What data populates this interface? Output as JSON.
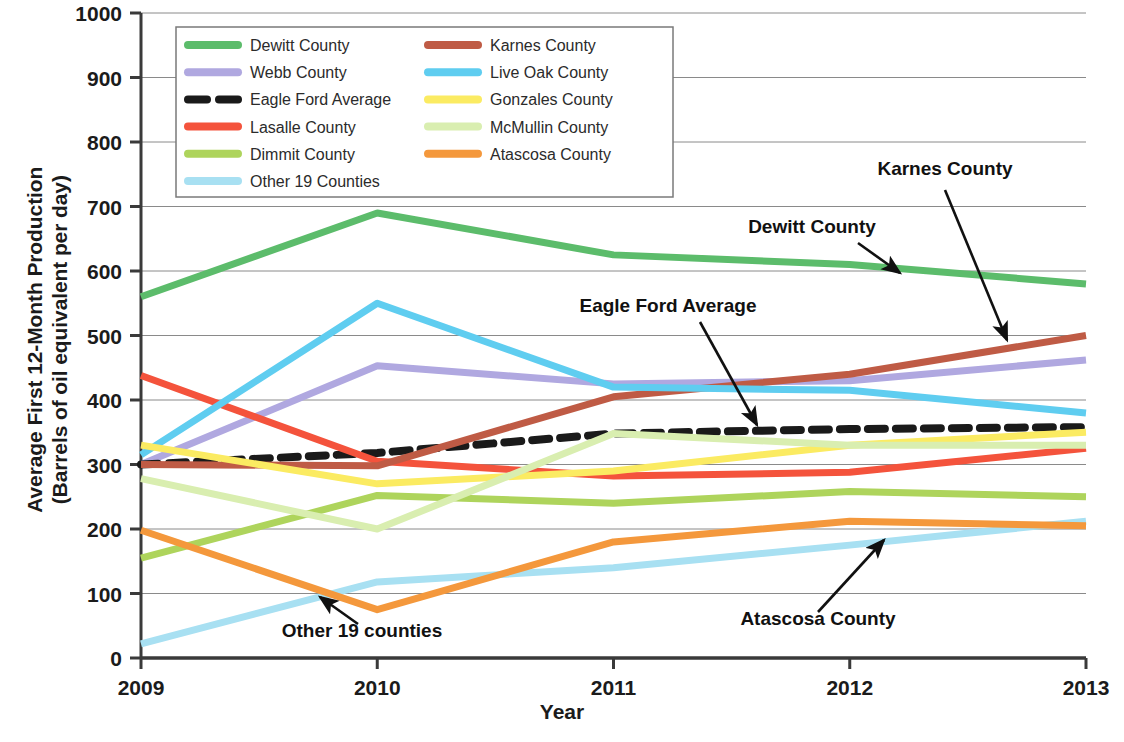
{
  "chart_data": {
    "type": "line",
    "title": "",
    "xlabel": "Year",
    "ylabel": "Average First 12-Month Production (Barrels of oil equivalent per day)",
    "ylabel_line1": "Average First 12-Month Production",
    "ylabel_line2": "(Barrels of oil equivalent per day)",
    "x": [
      2009,
      2010,
      2011,
      2012,
      2013
    ],
    "categories": [
      "2009",
      "2010",
      "2011",
      "2012",
      "2013"
    ],
    "xtick_labels": [
      "2009",
      "2010",
      "2011",
      "2012",
      "2013"
    ],
    "ytick_labels": [
      "0",
      "100",
      "200",
      "300",
      "400",
      "500",
      "600",
      "700",
      "800",
      "900",
      "1000"
    ],
    "ytick_values": [
      0,
      100,
      200,
      300,
      400,
      500,
      600,
      700,
      800,
      900,
      1000
    ],
    "ylim": [
      0,
      1000
    ],
    "xlim": [
      2009,
      2013
    ],
    "grid": "horizontal",
    "legend_position": "top-left-inside",
    "series": [
      {
        "name": "Dewitt County",
        "color": "#5cbc6b",
        "dash": false,
        "values": [
          560,
          690,
          625,
          610,
          580
        ]
      },
      {
        "name": "Webb County",
        "color": "#b0a8e0",
        "dash": false,
        "values": [
          300,
          453,
          425,
          430,
          462
        ]
      },
      {
        "name": "Eagle Ford Average",
        "color": "#1a1a1a",
        "dash": true,
        "values": [
          300,
          318,
          348,
          355,
          358
        ]
      },
      {
        "name": "Lasalle County",
        "color": "#f4533c",
        "dash": false,
        "values": [
          438,
          305,
          282,
          288,
          325
        ]
      },
      {
        "name": "Dimmit County",
        "color": "#aed45c",
        "dash": false,
        "values": [
          155,
          252,
          240,
          258,
          250
        ]
      },
      {
        "name": "Other 19 Counties",
        "color": "#a8e0f2",
        "dash": false,
        "values": [
          22,
          118,
          140,
          175,
          212
        ]
      },
      {
        "name": "Karnes County",
        "color": "#bf5b45",
        "dash": false,
        "values": [
          300,
          298,
          405,
          440,
          500
        ]
      },
      {
        "name": "Live Oak County",
        "color": "#5fcdf0",
        "dash": false,
        "values": [
          315,
          550,
          420,
          415,
          380
        ]
      },
      {
        "name": "Gonzales County",
        "color": "#fbeb62",
        "dash": false,
        "values": [
          330,
          270,
          290,
          330,
          350
        ]
      },
      {
        "name": "McMullin County",
        "color": "#d9eeb0",
        "dash": false,
        "values": [
          278,
          200,
          348,
          330,
          330
        ]
      },
      {
        "name": "Atascosa County",
        "color": "#f4983c",
        "dash": false,
        "values": [
          198,
          75,
          180,
          212,
          205
        ]
      }
    ],
    "annotations": [
      {
        "label": "Karnes County",
        "text_x": 945,
        "text_y": 175,
        "arrow_from_x": 945,
        "arrow_from_y": 190,
        "arrow_to_x": 1007,
        "arrow_to_y": 340
      },
      {
        "label": "Dewitt County",
        "text_x": 812,
        "text_y": 233,
        "arrow_from_x": 858,
        "arrow_from_y": 243,
        "arrow_to_x": 900,
        "arrow_to_y": 273
      },
      {
        "label": "Eagle Ford Average",
        "text_x": 668,
        "text_y": 312,
        "arrow_from_x": 700,
        "arrow_from_y": 322,
        "arrow_to_x": 757,
        "arrow_to_y": 425
      },
      {
        "label": "Atascosa County",
        "text_x": 818,
        "text_y": 625,
        "arrow_from_x": 818,
        "arrow_from_y": 612,
        "arrow_to_x": 884,
        "arrow_to_y": 540
      },
      {
        "label": "Other 19 counties",
        "text_x": 362,
        "text_y": 637,
        "arrow_from_x": 358,
        "arrow_from_y": 624,
        "arrow_to_x": 320,
        "arrow_to_y": 597
      }
    ]
  },
  "legend": {
    "entries": [
      {
        "label": "Dewitt County"
      },
      {
        "label": "Webb County"
      },
      {
        "label": "Eagle Ford Average"
      },
      {
        "label": "Lasalle County"
      },
      {
        "label": "Dimmit County"
      },
      {
        "label": "Other 19 Counties"
      },
      {
        "label": "Karnes County"
      },
      {
        "label": "Live Oak County"
      },
      {
        "label": "Gonzales County"
      },
      {
        "label": "McMullin County"
      },
      {
        "label": "Atascosa County"
      }
    ]
  }
}
